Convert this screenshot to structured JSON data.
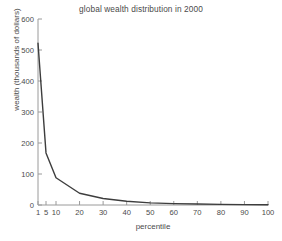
{
  "chart_data": {
    "type": "line",
    "title": "global wealth distribution in 2000",
    "xlabel": "percentile",
    "ylabel": "wealth (thousands of dollars)",
    "x": [
      1,
      5,
      10,
      20,
      30,
      40,
      50,
      60,
      70,
      80,
      90,
      100
    ],
    "values": [
      522,
      168,
      88,
      38,
      21,
      12,
      7,
      4.5,
      3,
      2,
      1.2,
      0.6
    ],
    "series": [
      {
        "name": "wealth",
        "values": [
          522,
          168,
          88,
          38,
          21,
          12,
          7,
          4.5,
          3,
          2,
          1.2,
          0.6
        ]
      }
    ],
    "xticks": [
      "1",
      "5",
      "10",
      "20",
      "30",
      "40",
      "50",
      "60",
      "70",
      "80",
      "90",
      "100"
    ],
    "yticks": [
      "0",
      "100",
      "200",
      "300",
      "400",
      "500",
      "600"
    ],
    "xlim": [
      1,
      100
    ],
    "ylim": [
      0,
      600
    ],
    "grid": false,
    "legend": false,
    "line_color": "#3d3d3d",
    "axis_color": "#9a9a9a"
  },
  "axes": {
    "title": "global wealth distribution in 2000",
    "xlabel": "percentile",
    "ylabel": "wealth (thousands of dollars)",
    "ytick_labels": [
      "600",
      "500",
      "400",
      "300",
      "200",
      "100",
      "0"
    ],
    "xtick_labels": [
      "1",
      "5",
      "10",
      "20",
      "30",
      "40",
      "50",
      "60",
      "70",
      "80",
      "90",
      "100"
    ]
  }
}
